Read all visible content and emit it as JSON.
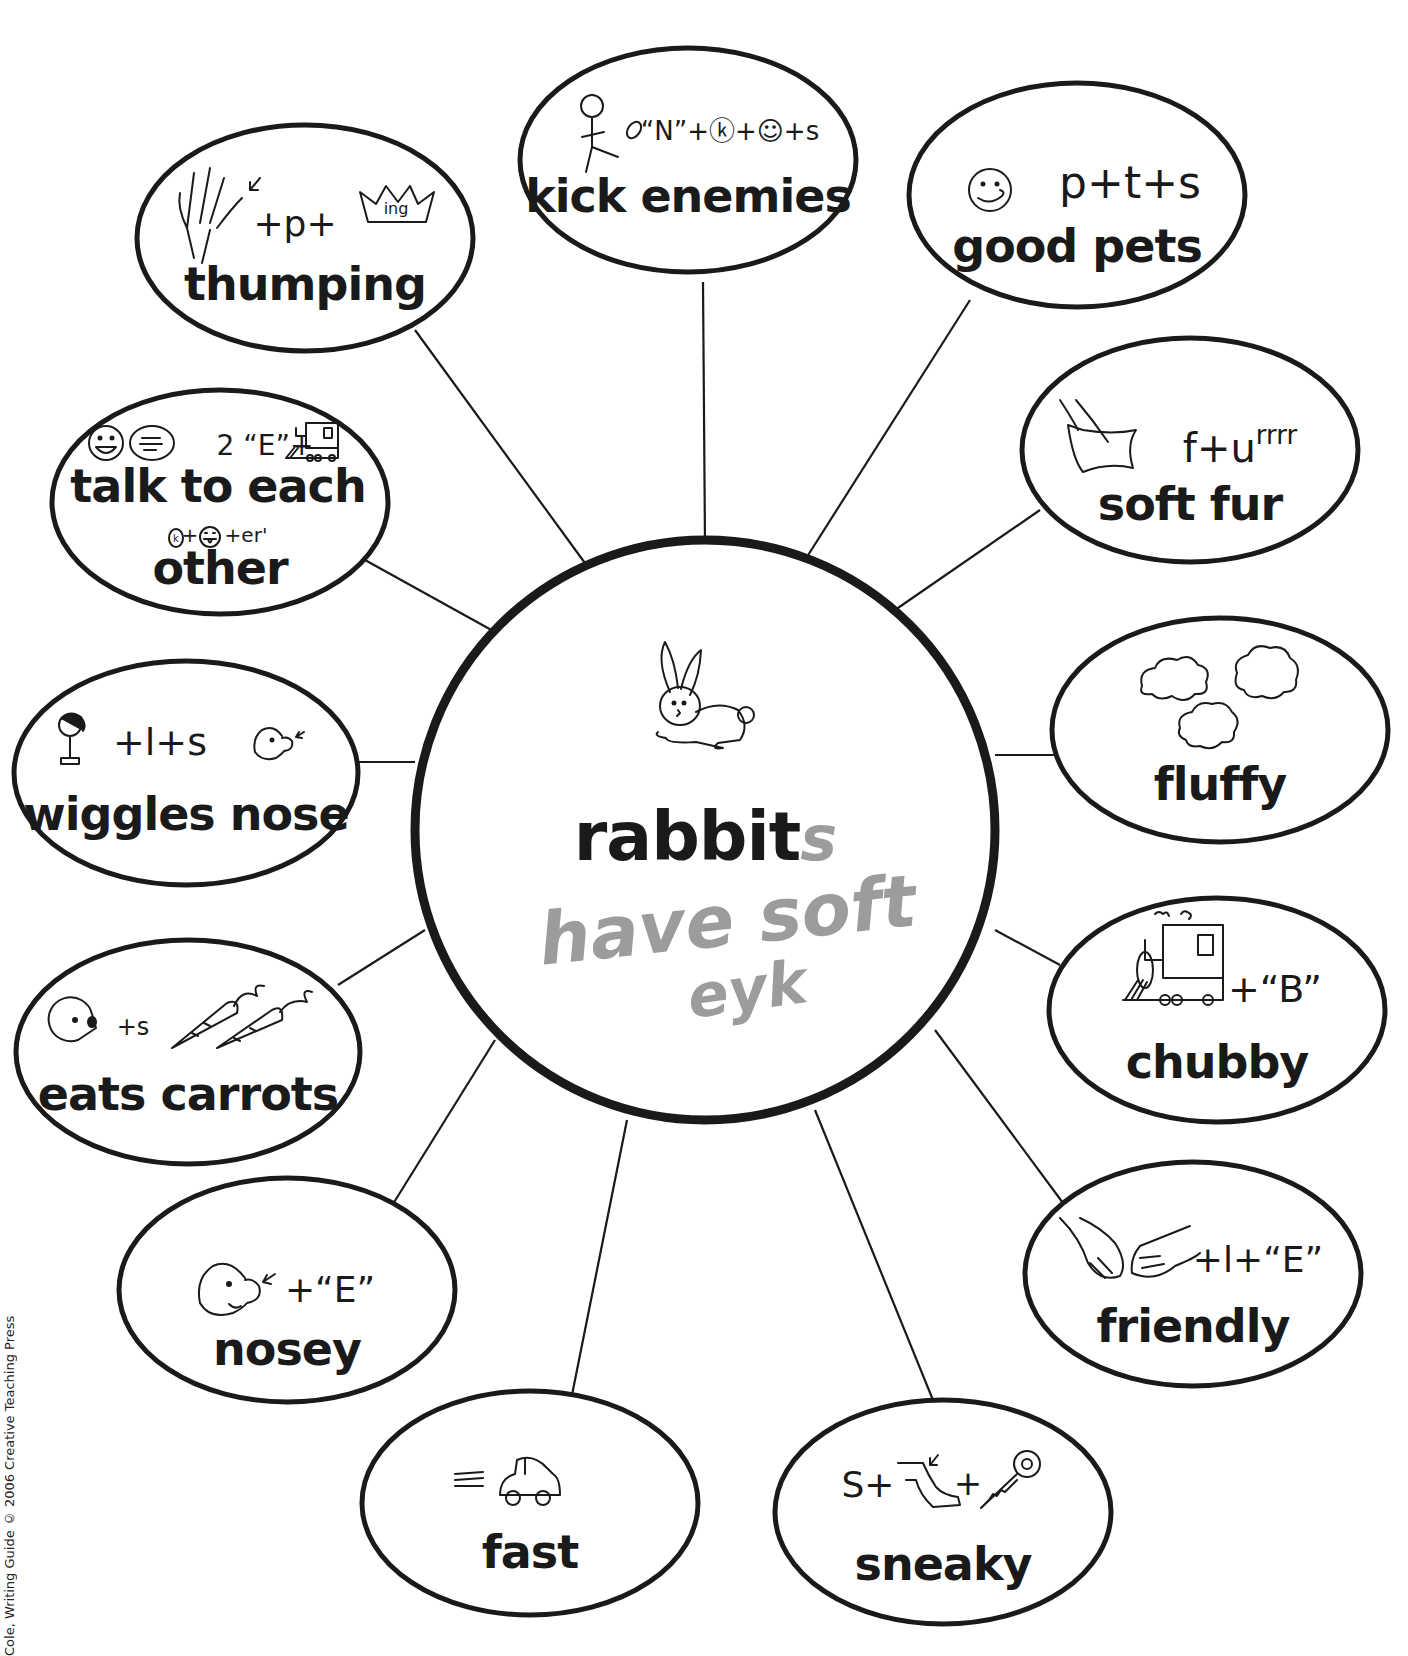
{
  "center": {
    "label": "rabbits",
    "printed_word": "rabbit",
    "handwritten_suffix": "s",
    "icon": "rabbit-icon",
    "handwriting": {
      "line1": "have soft",
      "line2": "eyk",
      "color": "#9c9c9c"
    }
  },
  "bubbles": [
    {
      "id": "thumping",
      "label": "thumping",
      "rebus": "✋↙ + p + ♛ing",
      "icon": "hand-crown-icon"
    },
    {
      "id": "kick-enemies",
      "label": "kick enemies",
      "rebus": "“N”+ⓚ+☺+s",
      "icon": "stick-figure-kicking-football-icon"
    },
    {
      "id": "good-pets",
      "label": "good pets",
      "rebus": "p+t+s",
      "icon": "smiley-tongue-icon"
    },
    {
      "id": "soft-fur",
      "label": "soft fur",
      "rebus": "f+urrrr",
      "icon": "hand-on-pillow-icon"
    },
    {
      "id": "fluffy",
      "label": "fluffy",
      "rebus": "",
      "icon": "clouds-icon"
    },
    {
      "id": "chubby",
      "label": "chubby",
      "rebus": "+“B”",
      "icon": "train-icon"
    },
    {
      "id": "friendly",
      "label": "friendly",
      "rebus": "+l+“E”",
      "icon": "handshake-icon"
    },
    {
      "id": "sneaky",
      "label": "sneaky",
      "rebus_prefix": "S+",
      "rebus_mid": "+",
      "icon": "leg-key-icon"
    },
    {
      "id": "fast",
      "label": "fast",
      "rebus": "",
      "icon": "car-icon"
    },
    {
      "id": "nosey",
      "label": "nosey",
      "rebus": "+“E”",
      "icon": "nose-face-icon"
    },
    {
      "id": "eats-carrots",
      "label": "eats carrots",
      "rebus": "+s",
      "icon": "pacman-carrots-icon"
    },
    {
      "id": "wiggles-nose",
      "label": "wiggles nose",
      "rebus": "+l+s",
      "icon": "girl-nose-icon"
    },
    {
      "id": "talk-to-each-other",
      "label_line1": "talk to each",
      "label_line2": "other",
      "rebus_line1": "2 “E”+",
      "rebus_line2": "+er'",
      "icon": "faces-speech-train-icon"
    }
  ],
  "credit": "Cole, Writing Guide © 2006 Creative Teaching Press"
}
